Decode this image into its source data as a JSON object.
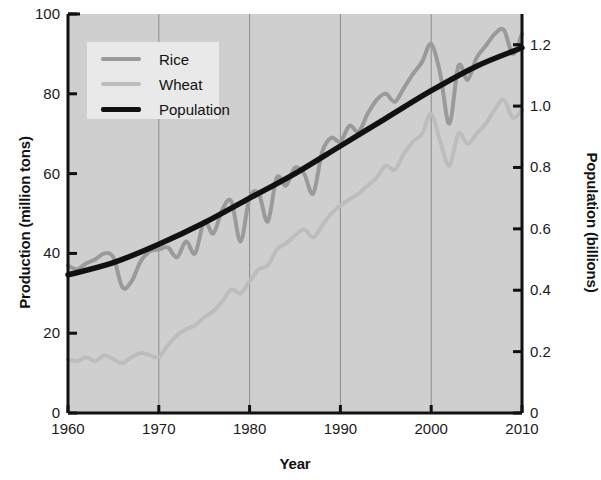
{
  "chart_data": {
    "type": "line",
    "title": "",
    "xlabel": "Year",
    "ylabel": "Production (million tons)",
    "ylabel_right": "Population (billions)",
    "xlim": [
      1960,
      2010
    ],
    "ylim": [
      0,
      100
    ],
    "ylim_right": [
      0,
      1.3
    ],
    "grid": "vertical-only",
    "legend_position": "top-left",
    "xticks": [
      "1960",
      "1970",
      "1980",
      "1990",
      "2000",
      "2010"
    ],
    "xtick_values": [
      1960,
      1970,
      1980,
      1990,
      2000,
      2010
    ],
    "yticks_left": [
      "0",
      "20",
      "40",
      "60",
      "80",
      "100"
    ],
    "ytick_values_left": [
      0,
      20,
      40,
      60,
      80,
      100
    ],
    "yticks_right": [
      "0",
      "0.2",
      "0.4",
      "0.6",
      "0.8",
      "1.0",
      "1.2"
    ],
    "ytick_values_right": [
      0,
      0.2,
      0.4,
      0.6,
      0.8,
      1.0,
      1.2
    ],
    "plot_bg_color": "#cfcfcf",
    "gridline_color": "#8a8a8a",
    "axis_color": "#111111",
    "series": [
      {
        "name": "Rice",
        "color": "#9a9a9a",
        "axis": "left",
        "units": "million tons",
        "x": [
          1960,
          1961,
          1962,
          1963,
          1964,
          1965,
          1966,
          1967,
          1968,
          1969,
          1970,
          1971,
          1972,
          1973,
          1974,
          1975,
          1976,
          1977,
          1978,
          1979,
          1980,
          1981,
          1982,
          1983,
          1984,
          1985,
          1986,
          1987,
          1988,
          1989,
          1990,
          1991,
          1992,
          1993,
          1994,
          1995,
          1996,
          1997,
          1998,
          1999,
          2000,
          2001,
          2002,
          2003,
          2004,
          2005,
          2006,
          2007,
          2008,
          2009,
          2010
        ],
        "values": [
          37,
          36,
          37.5,
          38.5,
          40,
          39,
          31.5,
          33,
          38,
          40.5,
          41,
          41.5,
          39,
          43,
          40,
          48,
          45,
          51,
          53,
          43,
          54,
          55,
          48,
          59,
          57,
          61.5,
          60,
          55,
          65.5,
          69,
          68,
          72,
          70.5,
          75,
          78.5,
          80,
          78,
          81.5,
          85,
          88,
          92.5,
          85,
          72.5,
          87,
          83.5,
          89,
          92,
          95,
          96,
          90,
          95
        ]
      },
      {
        "name": "Wheat",
        "color": "#bdbdbd",
        "axis": "left",
        "units": "million tons",
        "x": [
          1960,
          1961,
          1962,
          1963,
          1964,
          1965,
          1966,
          1967,
          1968,
          1969,
          1970,
          1971,
          1972,
          1973,
          1974,
          1975,
          1976,
          1977,
          1978,
          1979,
          1980,
          1981,
          1982,
          1983,
          1984,
          1985,
          1986,
          1987,
          1988,
          1989,
          1990,
          1991,
          1992,
          1993,
          1994,
          1995,
          1996,
          1997,
          1998,
          1999,
          2000,
          2001,
          2002,
          2003,
          2004,
          2005,
          2006,
          2007,
          2008,
          2009,
          2010
        ],
        "values": [
          13.5,
          13,
          14,
          13,
          14.5,
          13.5,
          12.5,
          14,
          15,
          14.5,
          14,
          17,
          19.5,
          21,
          22,
          24,
          25.5,
          28,
          31,
          30,
          33,
          36,
          37,
          41,
          42.5,
          44.5,
          46,
          44,
          47,
          50,
          52,
          53.5,
          55,
          57,
          59,
          62,
          61,
          65,
          68,
          70,
          75,
          68,
          62,
          70,
          67.5,
          70,
          72.5,
          76,
          78.5,
          74,
          76
        ]
      },
      {
        "name": "Population",
        "color": "#111111",
        "axis": "right",
        "units": "billions",
        "x": [
          1960,
          1965,
          1970,
          1975,
          1980,
          1985,
          1990,
          1995,
          2000,
          2005,
          2010
        ],
        "values": [
          0.45,
          0.49,
          0.55,
          0.62,
          0.7,
          0.78,
          0.87,
          0.96,
          1.05,
          1.13,
          1.19
        ]
      }
    ]
  },
  "legend": {
    "items": [
      {
        "label": "Rice",
        "color": "#9a9a9a"
      },
      {
        "label": "Wheat",
        "color": "#bdbdbd"
      },
      {
        "label": "Population",
        "color": "#111111"
      }
    ]
  },
  "axes": {
    "x_title": "Year",
    "y_left_title": "Production (million tons)",
    "y_right_title": "Population (billions)"
  }
}
